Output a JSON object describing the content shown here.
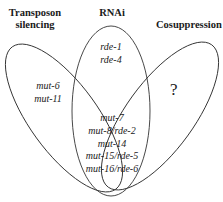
{
  "diagram": {
    "type": "venn",
    "sets": [
      {
        "id": "transposon",
        "title_line1": "Transposon",
        "title_line2": "silencing"
      },
      {
        "id": "rnai",
        "title_line1": "RNAi"
      },
      {
        "id": "cosuppression",
        "title_line1": "Cosuppression"
      }
    ],
    "regions": {
      "transposon_only": {
        "items": [
          "mut-6",
          "mut-11"
        ]
      },
      "rnai_only": {
        "items": [
          "rde-1",
          "rde-4"
        ]
      },
      "cosuppression_only": {
        "symbol": "?"
      },
      "all_three": {
        "items": [
          "mut-7",
          "mut-8/rde-2",
          "mut-14",
          "mut-15/rde-5",
          "mut-16/rde-6"
        ]
      }
    },
    "colors": {
      "stroke": "#333333",
      "text": "#1a1a1a",
      "background": "#ffffff"
    }
  }
}
